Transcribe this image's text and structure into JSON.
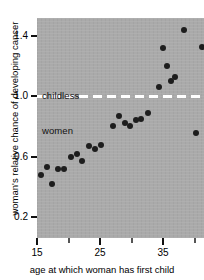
{
  "chart_data": {
    "type": "scatter",
    "title": "",
    "xlabel": "age at which woman has first child",
    "ylabel": "woman's relative chance of developing cancer",
    "xlim": [
      15,
      41.5
    ],
    "ylim": [
      0.06,
      1.52
    ],
    "grid": false,
    "legend": null,
    "x_ticks": [
      15,
      20,
      25,
      30,
      35,
      40
    ],
    "x_tick_labels": [
      "15",
      "",
      "25",
      "",
      "35",
      ""
    ],
    "y_ticks": [
      0.2,
      0.4,
      0.6,
      0.8,
      1.0,
      1.2,
      1.4
    ],
    "y_tick_labels": [
      "0.2",
      "",
      "0.6",
      "",
      "1.0",
      "",
      "1.4"
    ],
    "series": [
      {
        "name": "relative chance of developing cancer",
        "marker": "filled-circle",
        "color": "#1d1d1d",
        "points": [
          {
            "x": 15.6,
            "y": 0.48
          },
          {
            "x": 16.6,
            "y": 0.53
          },
          {
            "x": 17.4,
            "y": 0.42
          },
          {
            "x": 18.4,
            "y": 0.52
          },
          {
            "x": 19.3,
            "y": 0.52
          },
          {
            "x": 20.4,
            "y": 0.6
          },
          {
            "x": 21.3,
            "y": 0.62
          },
          {
            "x": 22.2,
            "y": 0.57
          },
          {
            "x": 23.2,
            "y": 0.67
          },
          {
            "x": 24.2,
            "y": 0.65
          },
          {
            "x": 25.1,
            "y": 0.68
          },
          {
            "x": 27.0,
            "y": 0.8
          },
          {
            "x": 28.0,
            "y": 0.87
          },
          {
            "x": 29.0,
            "y": 0.82
          },
          {
            "x": 29.8,
            "y": 0.8
          },
          {
            "x": 30.7,
            "y": 0.84
          },
          {
            "x": 31.5,
            "y": 0.85
          },
          {
            "x": 32.6,
            "y": 0.89
          },
          {
            "x": 34.3,
            "y": 1.06
          },
          {
            "x": 35.0,
            "y": 1.32
          },
          {
            "x": 35.6,
            "y": 1.2
          },
          {
            "x": 36.3,
            "y": 1.1
          },
          {
            "x": 36.9,
            "y": 1.13
          },
          {
            "x": 38.4,
            "y": 1.44
          },
          {
            "x": 40.2,
            "y": 0.76
          },
          {
            "x": 41.2,
            "y": 1.33
          }
        ]
      }
    ],
    "annotations": [
      {
        "name": "childless-women-reference",
        "type": "hline",
        "y": 1.0,
        "style": "dashed",
        "color": "#ffffff",
        "label": "childless\nwomen",
        "label_line_1": "childless",
        "label_line_2": "women"
      }
    ],
    "panel_background": "#aaaaaa",
    "figure_background": "#ffffff"
  }
}
